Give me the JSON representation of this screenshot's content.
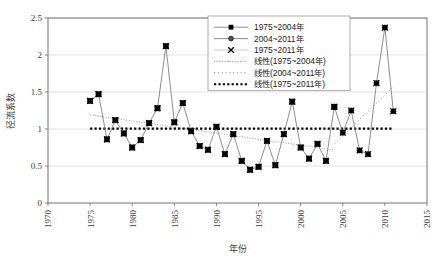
{
  "chart_data": {
    "type": "line",
    "title": "",
    "xlabel": "年份",
    "ylabel": "径流系数",
    "xlim": [
      1970,
      2015
    ],
    "ylim": [
      0,
      2.5
    ],
    "xticks": [
      "1970",
      "1975",
      "1980",
      "1985",
      "1990",
      "1995",
      "2000",
      "2005",
      "2010",
      "2015"
    ],
    "yticks": [
      "0",
      "0.5",
      "1",
      "1.5",
      "2",
      "2.5"
    ],
    "grid": "horizontal",
    "legend_position": "top-right",
    "x": [
      1975,
      1976,
      1977,
      1978,
      1979,
      1980,
      1981,
      1982,
      1983,
      1984,
      1985,
      1986,
      1987,
      1988,
      1989,
      1990,
      1991,
      1992,
      1993,
      1994,
      1995,
      1996,
      1997,
      1998,
      1999,
      2000,
      2001,
      2002,
      2003,
      2004,
      2005,
      2006,
      2007,
      2008,
      2009,
      2010,
      2011
    ],
    "series": [
      {
        "name": "1975~2004年",
        "marker": "filled-square",
        "x": [
          1975,
          1976,
          1977,
          1978,
          1979,
          1980,
          1981,
          1982,
          1983,
          1984,
          1985,
          1986,
          1987,
          1988,
          1989,
          1990,
          1991,
          1992,
          1993,
          1994,
          1995,
          1996,
          1997,
          1998,
          1999,
          2000,
          2001,
          2002,
          2003,
          2004
        ],
        "values": [
          1.38,
          1.47,
          0.86,
          1.12,
          0.94,
          0.75,
          0.85,
          1.08,
          1.28,
          2.12,
          1.09,
          1.35,
          0.97,
          0.77,
          0.72,
          1.03,
          0.66,
          0.93,
          0.57,
          0.45,
          0.49,
          0.84,
          0.51,
          0.93,
          1.37,
          0.75,
          0.6,
          0.8,
          0.57,
          1.3
        ]
      },
      {
        "name": "2004~2011年",
        "marker": "filled-circle",
        "x": [
          2004,
          2005,
          2006,
          2007,
          2008,
          2009,
          2010,
          2011
        ],
        "values": [
          1.3,
          0.95,
          1.25,
          0.71,
          0.66,
          1.62,
          2.37,
          1.24
        ]
      },
      {
        "name": "1975~2011年",
        "marker": "cross",
        "x": [
          1975,
          1976,
          1977,
          1978,
          1979,
          1980,
          1981,
          1982,
          1983,
          1984,
          1985,
          1986,
          1987,
          1988,
          1989,
          1990,
          1991,
          1992,
          1993,
          1994,
          1995,
          1996,
          1997,
          1998,
          1999,
          2000,
          2001,
          2002,
          2003,
          2004,
          2005,
          2006,
          2007,
          2008,
          2009,
          2010,
          2011
        ],
        "values": [
          1.38,
          1.47,
          0.86,
          1.12,
          0.94,
          0.75,
          0.85,
          1.08,
          1.28,
          2.12,
          1.09,
          1.35,
          0.97,
          0.77,
          0.72,
          1.03,
          0.66,
          0.93,
          0.57,
          0.45,
          0.49,
          0.84,
          0.51,
          0.93,
          1.37,
          0.75,
          0.6,
          0.8,
          0.57,
          1.3,
          0.95,
          1.25,
          0.71,
          0.66,
          1.62,
          2.37,
          1.24
        ]
      }
    ],
    "trendlines": [
      {
        "name": "线性(1975~2004年)",
        "style": "fine-dotted",
        "x0": 1975,
        "y0": 1.19,
        "x1": 2004,
        "y1": 0.715
      },
      {
        "name": "线性(2004~2011年)",
        "style": "sparse-dotted",
        "x0": 2004,
        "y0": 0.8,
        "x1": 2011,
        "y1": 1.57
      },
      {
        "name": "线性(1975~2011年)",
        "style": "bold-dotted",
        "x0": 1975,
        "y0": 1.005,
        "x1": 2011,
        "y1": 1.005
      }
    ],
    "legend": [
      {
        "label": "1975~2004年",
        "glyph": "line-marker-square"
      },
      {
        "label": "2004~2011年",
        "glyph": "line-marker-circle"
      },
      {
        "label": "1975~2011年",
        "glyph": "line-marker-cross"
      },
      {
        "label": "线性(1975~2004年)",
        "glyph": "dotted-line"
      },
      {
        "label": "线性(2004~2011年)",
        "glyph": "dotted-line-sparse"
      },
      {
        "label": "线性(1975~2011年)",
        "glyph": "dotted-line-bold"
      }
    ],
    "colors": {
      "axis": "#808080",
      "grid": "#d9d9d9",
      "series_line": "#808080",
      "marker": "#000000",
      "trend_bold": "#000000",
      "background": "#ffffff"
    }
  }
}
